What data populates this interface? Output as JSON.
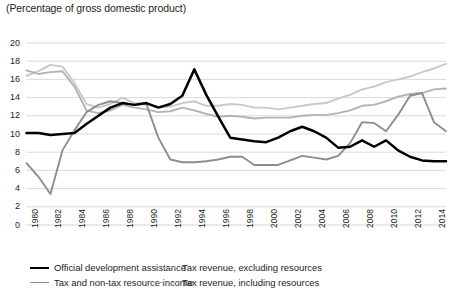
{
  "subtitle": "(Percentage of gross domestic product)",
  "colors": {
    "oda": "#000000",
    "tax_nontax_resource": "#8d8d8d",
    "tax_excl_resources": "#c9c9c9",
    "tax_incl_resources": "#b3b3b3",
    "gridline": "#d6d6d6",
    "text": "#231f20"
  },
  "legend": {
    "items": [
      {
        "label": "Official development assistance",
        "color_key": "oda",
        "width": 2.6,
        "col": 0,
        "row": 0
      },
      {
        "label": "Tax and non-tax resource income",
        "color_key": "tax_nontax_resource",
        "width": 1.8,
        "col": 0,
        "row": 1
      },
      {
        "label": "Tax revenue, excluding resources",
        "color_key": "tax_excl_resources",
        "width": 1.8,
        "col": 1,
        "row": 0
      },
      {
        "label": "Tax revenue, including resources",
        "color_key": "tax_incl_resources",
        "width": 1.8,
        "col": 1,
        "row": 1
      }
    ]
  },
  "chart_data": {
    "type": "line",
    "title": "",
    "subtitle": "(Percentage of gross domestic product)",
    "xlabel": "",
    "ylabel": "",
    "ylim": [
      0,
      20
    ],
    "ytick_step": 2,
    "yticks": [
      0,
      2,
      4,
      6,
      8,
      10,
      12,
      14,
      16,
      18,
      20
    ],
    "grid": true,
    "legend_position": "bottom",
    "x": [
      1980,
      1981,
      1982,
      1983,
      1984,
      1985,
      1986,
      1987,
      1988,
      1989,
      1990,
      1991,
      1992,
      1993,
      1994,
      1995,
      1996,
      1997,
      1998,
      1999,
      2000,
      2001,
      2002,
      2003,
      2004,
      2005,
      2006,
      2007,
      2008,
      2009,
      2010,
      2011,
      2012,
      2013,
      2014,
      2015
    ],
    "xtick_labels": [
      "1980",
      "1982",
      "1984",
      "1986",
      "1988",
      "1990",
      "1992",
      "1994",
      "1996",
      "1998",
      "2000",
      "2002",
      "2004",
      "2006",
      "2008",
      "2010",
      "2012",
      "2014"
    ],
    "series": [
      {
        "name": "Official development assistance",
        "color_key": "oda",
        "values": [
          10.1,
          10.1,
          9.9,
          10.0,
          10.1,
          11.1,
          12.0,
          12.9,
          13.4,
          13.2,
          13.4,
          12.9,
          13.3,
          14.2,
          17.1,
          14.3,
          11.9,
          9.6,
          9.4,
          9.2,
          9.1,
          9.6,
          10.3,
          10.8,
          10.3,
          9.6,
          8.5,
          8.6,
          9.3,
          8.6,
          9.3,
          8.2,
          7.5,
          7.1,
          7.0,
          7.0
        ]
      },
      {
        "name": "Tax and non-tax resource income",
        "color_key": "tax_nontax_resource",
        "values": [
          6.8,
          5.3,
          3.4,
          8.2,
          10.4,
          12.4,
          13.2,
          13.6,
          13.4,
          13.2,
          13.3,
          9.6,
          7.2,
          6.9,
          6.9,
          7.0,
          7.2,
          7.5,
          7.5,
          6.6,
          6.6,
          6.6,
          7.1,
          7.6,
          7.4,
          7.2,
          7.6,
          9.0,
          11.3,
          11.2,
          10.3,
          12.1,
          14.2,
          14.5,
          11.3,
          10.3
        ]
      },
      {
        "name": "Tax revenue, excluding resources",
        "color_key": "tax_excl_resources",
        "values": [
          16.4,
          16.9,
          17.6,
          17.4,
          15.6,
          13.3,
          12.9,
          13.3,
          14.0,
          13.4,
          13.3,
          13.0,
          13.0,
          13.4,
          13.6,
          13.1,
          13.1,
          13.3,
          13.2,
          12.9,
          12.9,
          12.7,
          12.9,
          13.1,
          13.3,
          13.4,
          13.9,
          14.3,
          14.9,
          15.2,
          15.7,
          16.0,
          16.3,
          16.8,
          17.2,
          17.7
        ]
      },
      {
        "name": "Tax revenue, including resources",
        "color_key": "tax_incl_resources",
        "values": [
          17.0,
          16.6,
          16.8,
          16.9,
          15.2,
          12.6,
          12.3,
          12.6,
          13.2,
          12.9,
          12.7,
          12.4,
          12.5,
          12.9,
          12.6,
          12.2,
          11.9,
          12.0,
          11.9,
          11.7,
          11.8,
          11.8,
          11.8,
          12.0,
          12.1,
          12.1,
          12.3,
          12.6,
          13.1,
          13.2,
          13.6,
          14.1,
          14.4,
          14.5,
          14.9,
          15.0
        ]
      }
    ]
  }
}
